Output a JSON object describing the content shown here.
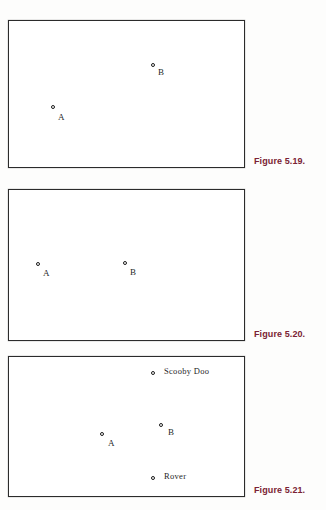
{
  "page": {
    "background_color": "#fdfdfc",
    "width": 326,
    "height": 510
  },
  "style": {
    "caption_color": "#7a2233",
    "frame_color": "#2b2b2b",
    "marker_color": "#1d1d1d",
    "label_color": "#1f1f1f"
  },
  "figures": [
    {
      "id": "figure-5-19",
      "caption": "Figure 5.19.",
      "frame": {
        "x": 8,
        "y": 20,
        "w": 237,
        "h": 148
      },
      "caption_pos": {
        "x": 254,
        "y": 156
      },
      "points": [
        {
          "name": "B",
          "label": "B",
          "marker": {
            "x": 152,
            "y": 64
          },
          "label_pos": {
            "x": 159,
            "y": 69
          }
        },
        {
          "name": "A",
          "label": "A",
          "marker": {
            "x": 52,
            "y": 106
          },
          "label_pos": {
            "x": 59,
            "y": 114
          }
        }
      ]
    },
    {
      "id": "figure-5-20",
      "caption": "Figure 5.20.",
      "frame": {
        "x": 8,
        "y": 189,
        "w": 237,
        "h": 152
      },
      "caption_pos": {
        "x": 254,
        "y": 329
      },
      "points": [
        {
          "name": "A",
          "label": "A",
          "marker": {
            "x": 37,
            "y": 263
          },
          "label_pos": {
            "x": 44,
            "y": 270
          }
        },
        {
          "name": "B",
          "label": "B",
          "marker": {
            "x": 124,
            "y": 262
          },
          "label_pos": {
            "x": 131,
            "y": 269
          }
        }
      ]
    },
    {
      "id": "figure-5-21",
      "caption": "Figure 5.21.",
      "frame": {
        "x": 8,
        "y": 356,
        "w": 237,
        "h": 141
      },
      "caption_pos": {
        "x": 254,
        "y": 485
      },
      "points": [
        {
          "name": "scooby-doo",
          "label": "Scooby Doo",
          "marker": {
            "x": 152,
            "y": 372
          },
          "label_pos": {
            "x": 165,
            "y": 368
          }
        },
        {
          "name": "B",
          "label": "B",
          "marker": {
            "x": 160,
            "y": 424
          },
          "label_pos": {
            "x": 169,
            "y": 429
          }
        },
        {
          "name": "A",
          "label": "A",
          "marker": {
            "x": 101,
            "y": 433
          },
          "label_pos": {
            "x": 109,
            "y": 440
          }
        },
        {
          "name": "rover",
          "label": "Rover",
          "marker": {
            "x": 152,
            "y": 477
          },
          "label_pos": {
            "x": 165,
            "y": 473
          }
        }
      ]
    }
  ]
}
